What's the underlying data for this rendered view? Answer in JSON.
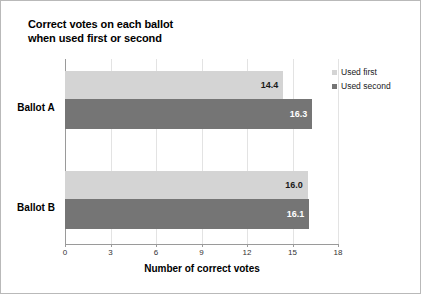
{
  "chart_data": {
    "type": "bar",
    "orientation": "horizontal",
    "title": "Correct votes on each ballot when used first or second",
    "title_lines": [
      "Correct votes on each ballot",
      "when used first or second"
    ],
    "categories": [
      "Ballot A",
      "Ballot B"
    ],
    "series": [
      {
        "name": "Used first",
        "values": [
          14.4,
          16.0
        ],
        "color": "#d4d4d4"
      },
      {
        "name": "Used second",
        "values": [
          16.3,
          16.1
        ],
        "color": "#757575"
      }
    ],
    "value_labels": [
      [
        "14.4",
        "16.3"
      ],
      [
        "16.0",
        "16.1"
      ]
    ],
    "xlabel": "Number of correct votes",
    "ylabel": "",
    "xlim": [
      0,
      18
    ],
    "xticks": [
      "0",
      "3",
      "6",
      "9",
      "12",
      "15",
      "18"
    ],
    "grid": true,
    "grid_axis": "x",
    "legend_position": "right"
  },
  "legend": {
    "items": [
      {
        "label": "Used first"
      },
      {
        "label": "Used second"
      }
    ]
  }
}
